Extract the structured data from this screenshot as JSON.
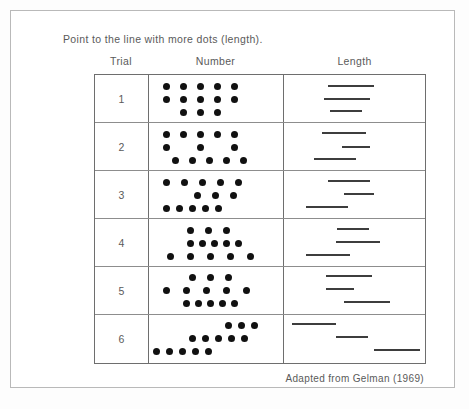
{
  "figure": {
    "prompt": "Point to the line with more dots (length).",
    "attribution": "Adapted from Gelman (1969)",
    "dot_color": "#111111",
    "line_color": "#3d3d3d",
    "border_color": "#6e6e6e"
  },
  "columns": {
    "trial": "Trial",
    "number": "Number",
    "length": "Length"
  },
  "chart_data": {
    "type": "table",
    "title": "Point to the line with more dots (length).",
    "columns": [
      "Trial",
      "Number",
      "Length"
    ],
    "note": "Adapted from Gelman (1969)",
    "rows": [
      {
        "trial": "1",
        "dot_count": 13,
        "line_count": 3,
        "dot_rows": [
          {
            "count": 5,
            "left": 14,
            "top": 7,
            "gap": 17
          },
          {
            "count": 5,
            "left": 14,
            "top": 20,
            "gap": 17
          },
          {
            "count": 3,
            "left": 31,
            "top": 33,
            "gap": 17
          }
        ],
        "lines": [
          {
            "left": 44,
            "top": 10,
            "width": 46
          },
          {
            "left": 40,
            "top": 23,
            "width": 46
          },
          {
            "left": 46,
            "top": 35,
            "width": 32
          }
        ]
      },
      {
        "trial": "2",
        "dot_count": 13,
        "line_count": 3,
        "dot_rows": [
          {
            "count": 5,
            "left": 14,
            "top": 7,
            "gap": 17
          },
          {
            "count": 1,
            "left": 14,
            "top": 20,
            "gap": 17
          },
          {
            "count": 1,
            "left": 48,
            "top": 20,
            "gap": 17
          },
          {
            "count": 1,
            "left": 82,
            "top": 20,
            "gap": 17
          },
          {
            "count": 5,
            "left": 23,
            "top": 33,
            "gap": 17
          }
        ],
        "lines": [
          {
            "left": 38,
            "top": 9,
            "width": 44
          },
          {
            "left": 58,
            "top": 23,
            "width": 28
          },
          {
            "left": 30,
            "top": 35,
            "width": 42
          }
        ]
      },
      {
        "trial": "3",
        "dot_count": 13,
        "line_count": 3,
        "dot_rows": [
          {
            "count": 5,
            "left": 14,
            "top": 7,
            "gap": 18
          },
          {
            "count": 3,
            "left": 45,
            "top": 20,
            "gap": 18
          },
          {
            "count": 5,
            "left": 14,
            "top": 33,
            "gap": 13
          }
        ],
        "lines": [
          {
            "left": 44,
            "top": 9,
            "width": 42
          },
          {
            "left": 60,
            "top": 22,
            "width": 30
          },
          {
            "left": 22,
            "top": 35,
            "width": 42
          }
        ]
      },
      {
        "trial": "4",
        "dot_count": 13,
        "line_count": 3,
        "dot_rows": [
          {
            "count": 3,
            "left": 38,
            "top": 7,
            "gap": 18
          },
          {
            "count": 5,
            "left": 38,
            "top": 20,
            "gap": 12
          },
          {
            "count": 5,
            "left": 18,
            "top": 33,
            "gap": 20
          }
        ],
        "lines": [
          {
            "left": 53,
            "top": 9,
            "width": 32
          },
          {
            "left": 52,
            "top": 22,
            "width": 44
          },
          {
            "left": 22,
            "top": 35,
            "width": 44
          }
        ]
      },
      {
        "trial": "5",
        "dot_count": 13,
        "line_count": 3,
        "dot_rows": [
          {
            "count": 3,
            "left": 40,
            "top": 6,
            "gap": 18
          },
          {
            "count": 5,
            "left": 14,
            "top": 19,
            "gap": 20
          },
          {
            "count": 5,
            "left": 34,
            "top": 32,
            "gap": 12
          }
        ],
        "lines": [
          {
            "left": 42,
            "top": 8,
            "width": 46
          },
          {
            "left": 42,
            "top": 21,
            "width": 28
          },
          {
            "left": 60,
            "top": 34,
            "width": 46
          }
        ]
      },
      {
        "trial": "6",
        "dot_count": 13,
        "line_count": 3,
        "dot_rows": [
          {
            "count": 3,
            "left": 76,
            "top": 6,
            "gap": 13
          },
          {
            "count": 5,
            "left": 40,
            "top": 19,
            "gap": 13
          },
          {
            "count": 5,
            "left": 4,
            "top": 32,
            "gap": 13
          }
        ],
        "lines": [
          {
            "left": 8,
            "top": 8,
            "width": 44
          },
          {
            "left": 52,
            "top": 21,
            "width": 32
          },
          {
            "left": 90,
            "top": 34,
            "width": 46
          }
        ]
      }
    ]
  }
}
